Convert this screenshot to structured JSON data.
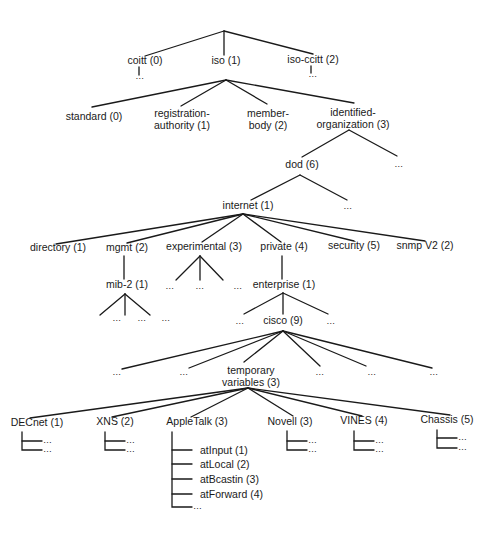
{
  "ellipsis": "…",
  "nodes": [
    {
      "id": "coitt",
      "label": "coitt (0)",
      "x": 145,
      "y": 64
    },
    {
      "id": "iso",
      "label": "iso (1)",
      "x": 226,
      "y": 64
    },
    {
      "id": "iso-ccitt",
      "label": "iso-ccitt (2)",
      "x": 313,
      "y": 63
    },
    {
      "id": "standard",
      "label": "standard (0)",
      "x": 94,
      "y": 120
    },
    {
      "id": "registration-authority",
      "label": [
        "registration-",
        "authority (1)"
      ],
      "x": 182,
      "y": 117
    },
    {
      "id": "member-body",
      "label": [
        "member-",
        "body (2)"
      ],
      "x": 268,
      "y": 117
    },
    {
      "id": "identified-organization",
      "label": [
        "identified-",
        "organization (3)"
      ],
      "x": 353,
      "y": 116
    },
    {
      "id": "dod",
      "label": "dod (6)",
      "x": 302,
      "y": 168
    },
    {
      "id": "internet",
      "label": "internet (1)",
      "x": 248,
      "y": 209
    },
    {
      "id": "directory",
      "label": "directory (1)",
      "x": 58,
      "y": 251
    },
    {
      "id": "mgmt",
      "label": "mgmt (2)",
      "x": 127,
      "y": 251
    },
    {
      "id": "experimental",
      "label": "experimental (3)",
      "x": 204,
      "y": 250
    },
    {
      "id": "private",
      "label": "private (4)",
      "x": 284,
      "y": 250
    },
    {
      "id": "security",
      "label": "security (5)",
      "x": 354,
      "y": 249
    },
    {
      "id": "snmpv2",
      "label": "snmp V2 (2)",
      "x": 425,
      "y": 249
    },
    {
      "id": "mib-2",
      "label": "mib-2 (1)",
      "x": 127,
      "y": 288
    },
    {
      "id": "enterprise",
      "label": "enterprise (1)",
      "x": 284,
      "y": 288
    },
    {
      "id": "cisco",
      "label": "cisco (9)",
      "x": 283,
      "y": 324
    },
    {
      "id": "temporary-variables",
      "label": [
        "temporary",
        "variables (3)"
      ],
      "x": 251,
      "y": 374
    },
    {
      "id": "decnet",
      "label": "DECnet (1)",
      "x": 37,
      "y": 426
    },
    {
      "id": "xns",
      "label": "XNS (2)",
      "x": 115,
      "y": 425
    },
    {
      "id": "appletalk",
      "label": "AppleTalk (3)",
      "x": 197,
      "y": 425
    },
    {
      "id": "novell",
      "label": "Novell (3)",
      "x": 290,
      "y": 425
    },
    {
      "id": "vines",
      "label": "VINES (4)",
      "x": 364,
      "y": 424
    },
    {
      "id": "chassis",
      "label": "Chassis (5)",
      "x": 447,
      "y": 423
    }
  ],
  "ellipses": [
    {
      "x": 140,
      "y": 79
    },
    {
      "x": 313,
      "y": 77
    },
    {
      "x": 399,
      "y": 167
    },
    {
      "x": 348,
      "y": 209
    },
    {
      "x": 117,
      "y": 321
    },
    {
      "x": 142,
      "y": 321
    },
    {
      "x": 166,
      "y": 321
    },
    {
      "x": 170,
      "y": 289
    },
    {
      "x": 200,
      "y": 289
    },
    {
      "x": 238,
      "y": 289
    },
    {
      "x": 240,
      "y": 324
    },
    {
      "x": 331,
      "y": 324
    },
    {
      "x": 117,
      "y": 375
    },
    {
      "x": 184,
      "y": 375
    },
    {
      "x": 320,
      "y": 375
    },
    {
      "x": 372,
      "y": 375
    },
    {
      "x": 434,
      "y": 375
    }
  ],
  "appletalk_children": [
    {
      "label": "atInput (1)"
    },
    {
      "label": "atLocal (2)"
    },
    {
      "label": "atBcastin (3)"
    },
    {
      "label": "atForward (4)"
    }
  ],
  "colors": {
    "ink": "#1a1a1a",
    "background": "#ffffff"
  }
}
